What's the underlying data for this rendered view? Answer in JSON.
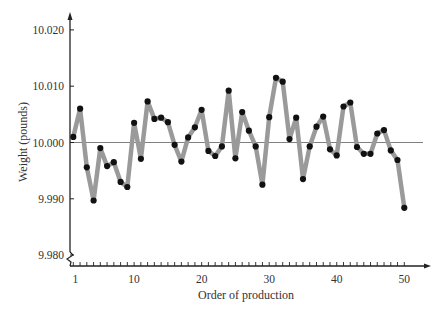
{
  "chart_data": {
    "type": "line",
    "title": "",
    "xlabel": "Order of production",
    "ylabel": "Weight (pounds)",
    "x": [
      1,
      2,
      3,
      4,
      5,
      6,
      7,
      8,
      9,
      10,
      11,
      12,
      13,
      14,
      15,
      16,
      17,
      18,
      19,
      20,
      21,
      22,
      23,
      24,
      25,
      26,
      27,
      28,
      29,
      30,
      31,
      32,
      33,
      34,
      35,
      36,
      37,
      38,
      39,
      40,
      41,
      42,
      43,
      44,
      45,
      46,
      47,
      48,
      49,
      50
    ],
    "values": [
      10.001,
      10.006,
      9.9956,
      9.9897,
      9.999,
      9.9958,
      9.9965,
      9.993,
      9.9921,
      10.0035,
      9.9971,
      10.0073,
      10.0042,
      10.0044,
      10.0036,
      9.9996,
      9.9966,
      10.0009,
      10.0027,
      10.0058,
      9.9985,
      9.9976,
      9.9993,
      10.0092,
      9.9972,
      10.0054,
      10.0021,
      9.9993,
      9.9925,
      10.0045,
      10.0115,
      10.0108,
      10.0006,
      10.0044,
      9.9935,
      9.9993,
      10.0028,
      10.0046,
      9.9988,
      9.9977,
      10.0064,
      10.0071,
      9.9992,
      9.998,
      9.998,
      10.0016,
      10.0022,
      9.9986,
      9.9969,
      9.9884
    ],
    "reference_line": {
      "value": 10.0,
      "label": "target"
    },
    "xticks_labeled": [
      1,
      10,
      20,
      30,
      40,
      50
    ],
    "yticks": [
      9.98,
      9.99,
      10.0,
      10.01,
      10.02
    ],
    "ytick_labels": [
      "9.980",
      "9.990",
      "10.000",
      "10.010",
      "10.020"
    ],
    "xtick_labels": [
      "1",
      "10",
      "20",
      "30",
      "40",
      "50"
    ],
    "xlim": [
      1,
      51
    ],
    "ylim": [
      9.98,
      10.022
    ],
    "y_axis_break": true,
    "grid": false,
    "legend": null,
    "colors": {
      "line": "#9a9a9a",
      "marker": "#111111",
      "axis": "#222222",
      "reference": "#808080"
    }
  }
}
